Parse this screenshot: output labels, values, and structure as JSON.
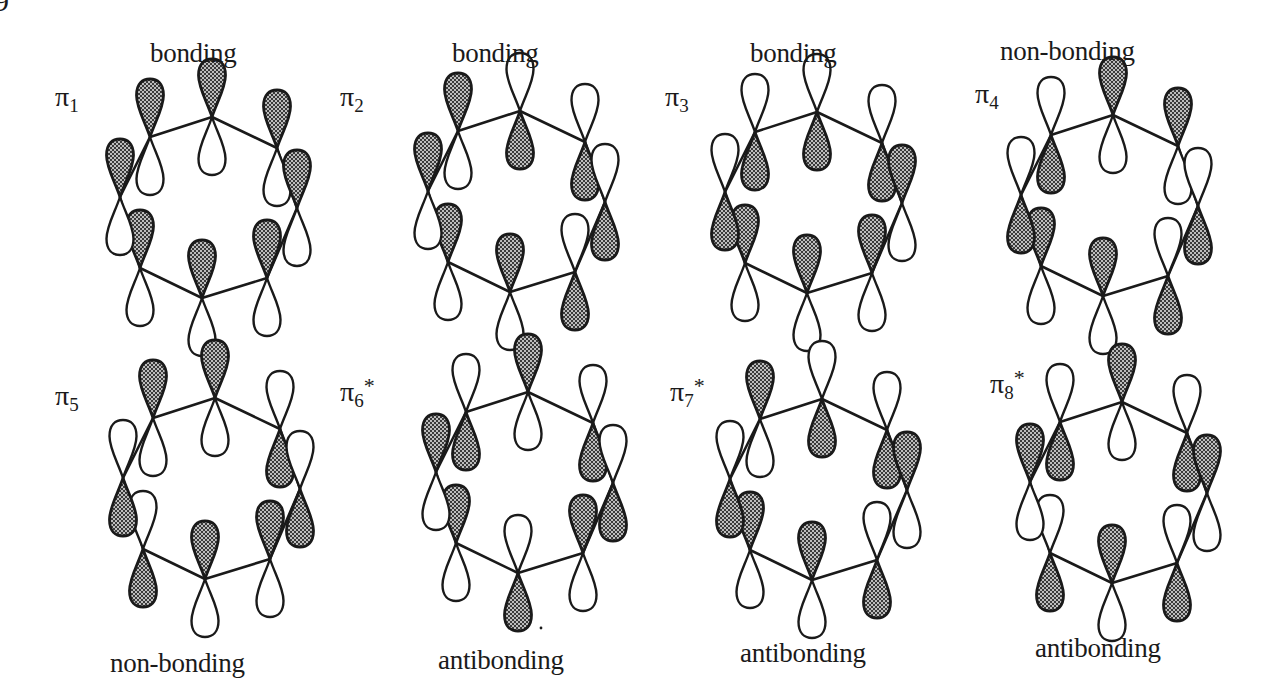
{
  "figure": {
    "corner_number": "9",
    "lobe_fill_pattern": "stipple",
    "colors": {
      "ink": "#1a1a1a",
      "stipple_dark": "#3a3a3a",
      "stipple_light": "#bdbdbd",
      "background": "#ffffff"
    },
    "atom_order": [
      "top",
      "upper-right",
      "right",
      "lower-right",
      "bottom",
      "lower-left",
      "left",
      "upper-left"
    ],
    "phase_legend": {
      "1": "upper lobe shaded",
      "-1": "lower lobe shaded"
    },
    "orbitals": [
      {
        "id": "pi1",
        "symbol": "π",
        "subscript": "1",
        "star": "",
        "character": "bonding",
        "character_position": "top",
        "phases": [
          1,
          1,
          1,
          1,
          1,
          1,
          1,
          1
        ],
        "origin": [
          0,
          0
        ],
        "symbol_pos": [
          55,
          83
        ],
        "character_pos": [
          150,
          40
        ]
      },
      {
        "id": "pi2",
        "symbol": "π",
        "subscript": "2",
        "star": "",
        "character": "bonding",
        "character_position": "top",
        "phases": [
          -1,
          -1,
          -1,
          -1,
          1,
          1,
          1,
          1
        ],
        "origin": [
          308,
          -6
        ],
        "symbol_pos": [
          340,
          83
        ],
        "character_pos": [
          452,
          40
        ]
      },
      {
        "id": "pi3",
        "symbol": "π",
        "subscript": "3",
        "star": "",
        "character": "bonding",
        "character_position": "top",
        "phases": [
          -1,
          -1,
          1,
          1,
          1,
          1,
          -1,
          -1
        ],
        "origin": [
          605,
          -5
        ],
        "symbol_pos": [
          665,
          83
        ],
        "character_pos": [
          750,
          40
        ]
      },
      {
        "id": "pi4",
        "symbol": "π",
        "subscript": "4",
        "star": "",
        "character": "non-bonding",
        "character_position": "top",
        "phases": [
          1,
          1,
          -1,
          -1,
          1,
          1,
          -1,
          -1
        ],
        "origin": [
          901,
          -2
        ],
        "symbol_pos": [
          975,
          80
        ],
        "character_pos": [
          1000,
          38
        ]
      },
      {
        "id": "pi5",
        "symbol": "π",
        "subscript": "5",
        "star": "",
        "character": "non-bonding",
        "character_position": "bottom",
        "phases": [
          1,
          -1,
          -1,
          1,
          1,
          -1,
          -1,
          1
        ],
        "origin": [
          3,
          281
        ],
        "symbol_pos": [
          55,
          382
        ],
        "character_pos": [
          110,
          650
        ]
      },
      {
        "id": "pi6",
        "symbol": "π",
        "subscript": "6",
        "star": "*",
        "character": "antibonding",
        "character_position": "bottom",
        "phases": [
          1,
          -1,
          -1,
          1,
          -1,
          1,
          1,
          -1
        ],
        "origin": [
          316,
          275
        ],
        "symbol_pos": [
          340,
          378
        ],
        "character_pos": [
          438,
          647
        ]
      },
      {
        "id": "pi7",
        "symbol": "π",
        "subscript": "7",
        "star": "*",
        "character": "antibonding",
        "character_position": "bottom",
        "phases": [
          -1,
          -1,
          1,
          -1,
          1,
          1,
          -1,
          1
        ],
        "origin": [
          610,
          282
        ],
        "symbol_pos": [
          670,
          378
        ],
        "character_pos": [
          740,
          640
        ]
      },
      {
        "id": "pi8",
        "symbol": "π",
        "subscript": "8",
        "star": "*",
        "character": "antibonding",
        "character_position": "bottom",
        "phases": [
          1,
          -1,
          1,
          -1,
          1,
          -1,
          1,
          -1
        ],
        "origin": [
          910,
          285
        ],
        "symbol_pos": [
          990,
          370
        ],
        "character_pos": [
          1035,
          635
        ]
      }
    ],
    "ring_geometry": {
      "atoms": [
        [
          212,
          117
        ],
        [
          277,
          148
        ],
        [
          297,
          208
        ],
        [
          267,
          278
        ],
        [
          202,
          298
        ],
        [
          140,
          268
        ],
        [
          120,
          197
        ],
        [
          150,
          137
        ]
      ],
      "lobe_length": 58,
      "lobe_width": 27
    },
    "artifacts": [
      {
        "type": "dot",
        "pos": [
          541,
          628
        ]
      }
    ]
  }
}
